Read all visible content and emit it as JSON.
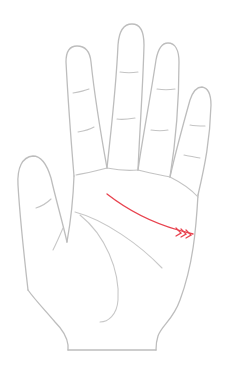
{
  "figure": {
    "hand": "right-hand-palm-up",
    "highlighted_line": "heart-line-with-branches",
    "colors": {
      "outline": "#bdbdbd",
      "creases": "#c4c4c4",
      "highlight": "#e8434f",
      "background": "#ffffff"
    }
  }
}
